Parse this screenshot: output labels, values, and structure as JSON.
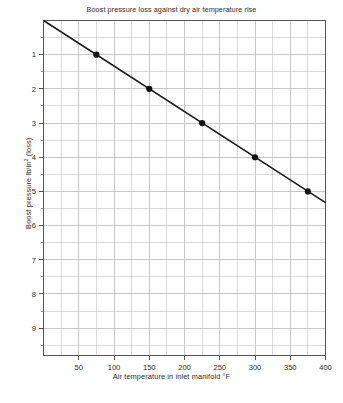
{
  "chart_data": {
    "type": "line",
    "title": "Boost pressure loss against dry air temperature rise",
    "xlabel": "Air temperature in inlet manifold °F",
    "ylabel_prefix": "Boost pressure  lb/in",
    "ylabel_sup": "2",
    "ylabel_suffix": " (loss)",
    "x": [
      75,
      150,
      225,
      300,
      375
    ],
    "values": [
      1,
      2,
      3,
      4,
      5
    ],
    "series": [
      {
        "name": "Boost pressure loss",
        "points": [
          {
            "x": 75,
            "y": 1
          },
          {
            "x": 150,
            "y": 2
          },
          {
            "x": 225,
            "y": 3
          },
          {
            "x": 300,
            "y": 4
          },
          {
            "x": 375,
            "y": 5
          }
        ]
      }
    ],
    "line_endpoints": [
      {
        "x": 0,
        "y": 0
      },
      {
        "x": 400,
        "y": 5.33
      }
    ],
    "xlim": [
      0,
      400
    ],
    "ylim": [
      0,
      9.8
    ],
    "y_axis_inverted": true,
    "xticks": [
      50,
      100,
      150,
      200,
      250,
      300,
      350,
      400
    ],
    "xtick_labels": [
      "50",
      "100",
      "150",
      "200",
      "250",
      "300",
      "350",
      "400"
    ],
    "yticks": [
      1,
      2,
      3,
      4,
      5,
      6,
      7,
      8,
      9
    ],
    "ytick_labels": [
      "1",
      "2",
      "3",
      "4",
      "5",
      "6",
      "7",
      "8",
      "9"
    ],
    "x_minor_step": 25,
    "y_minor_step": 0.5,
    "grid": true,
    "legend": null,
    "marker": "filled-circle",
    "marker_color": "#111111",
    "line_color": "#1a1a1a",
    "grid_color": "#b9b9b9",
    "frame_color": "#555555"
  }
}
